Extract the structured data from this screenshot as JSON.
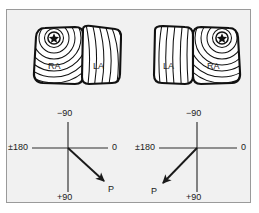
{
  "figure": {
    "background_color": "#f1f1f1",
    "frame_color": "#9a9a9a",
    "ink_color": "#1a1a1a"
  },
  "panels": [
    {
      "id": "left",
      "name": "right-atrial-origin-panel",
      "atria": {
        "left_chamber_label": "RA",
        "right_chamber_label": "LA",
        "focus_marker": "star-icon",
        "focus_chamber": "RA",
        "focus_position": "superior-left"
      },
      "axis": {
        "top_label": "−90",
        "left_label": "±180",
        "right_label": "0",
        "bottom_label": "+90",
        "vector_label": "P",
        "vector_direction": "down-right",
        "vector_angle_deg": 62
      }
    },
    {
      "id": "right",
      "name": "left-atrial-origin-panel",
      "atria": {
        "left_chamber_label": "LA",
        "right_chamber_label": "RA",
        "focus_marker": "star-icon",
        "focus_chamber": "RA",
        "focus_position": "superior-right"
      },
      "axis": {
        "top_label": "−90",
        "left_label": "±180",
        "right_label": "0",
        "bottom_label": "+90",
        "vector_label": "P",
        "vector_direction": "down-left",
        "vector_angle_deg": 118
      }
    }
  ]
}
